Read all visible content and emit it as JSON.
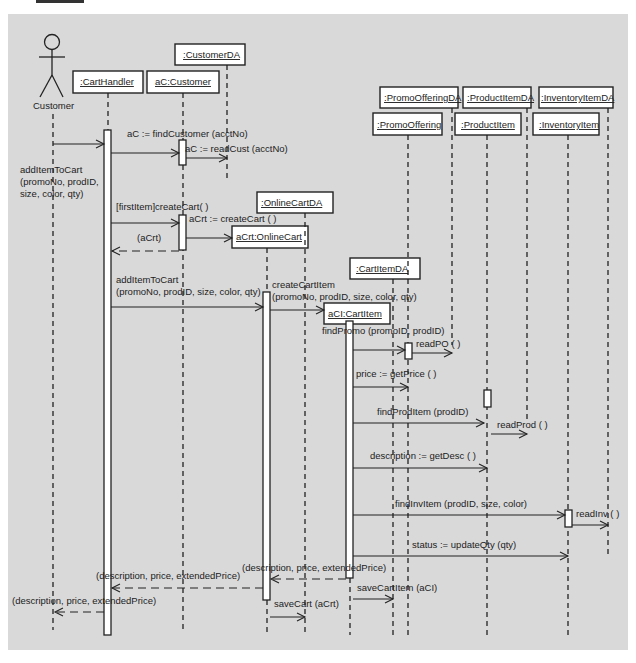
{
  "diagram": {
    "type": "sequence",
    "background": "#d9d9d9",
    "actor": {
      "name": "Customer"
    },
    "objects": [
      {
        "id": "cartHandler",
        "label": ":CartHandler"
      },
      {
        "id": "customer",
        "label": "aC:Customer"
      },
      {
        "id": "customerDA",
        "label": ":CustomerDA"
      },
      {
        "id": "onlineCartDA",
        "label": ":OnlineCartDA"
      },
      {
        "id": "onlineCart",
        "label": "aCrt:OnlineCart"
      },
      {
        "id": "cartItemDA",
        "label": ":CartItemDA"
      },
      {
        "id": "cartItem",
        "label": "aCI:CartItem"
      },
      {
        "id": "promoOfferingDA",
        "label": ":PromoOfferingDA"
      },
      {
        "id": "promoOffering",
        "label": ":PromoOffering"
      },
      {
        "id": "productItemDA",
        "label": ":ProductItemDA"
      },
      {
        "id": "productItem",
        "label": ":ProductItem"
      },
      {
        "id": "inventoryItemDA",
        "label": ":InventoryItemDA"
      },
      {
        "id": "inventoryItem",
        "label": ":InventoryItem"
      }
    ],
    "messages": [
      {
        "line1": "addItemToCart",
        "line2": "(promoNo, prodID,",
        "line3": "size, color, qty)"
      },
      {
        "text": "aC := findCustomer (acctNo)"
      },
      {
        "text": "aC := readCust (acctNo)"
      },
      {
        "text": "[firstItem]createCart( )"
      },
      {
        "text": "aCrt := createCart ( )"
      },
      {
        "text": "(aCrt)"
      },
      {
        "line1": "addItemToCart",
        "line2": "(promoNo, prodID, size, color, qty)"
      },
      {
        "line1": "createCartItem",
        "line2": "(promoNo, prodID, size, color, qty)"
      },
      {
        "text": "findPromo (promoID, prodID)"
      },
      {
        "text": "readPO ( )"
      },
      {
        "text": "price := getPrice ( )"
      },
      {
        "text": "findProdItem (prodID)"
      },
      {
        "text": "readProd ( )"
      },
      {
        "text": "description := getDesc ( )"
      },
      {
        "text": "findInvItem (prodID, size, color)"
      },
      {
        "text": "readInv ( )"
      },
      {
        "text": "status := updateQty (qty)"
      },
      {
        "text": "(description, price, extendedPrice)"
      },
      {
        "text": "(description, price, extendedPrice)"
      },
      {
        "text": "(description, price, extendedPrice)"
      },
      {
        "text": "saveCartItem (aCI)"
      },
      {
        "text": "saveCart (aCrt)"
      }
    ]
  }
}
